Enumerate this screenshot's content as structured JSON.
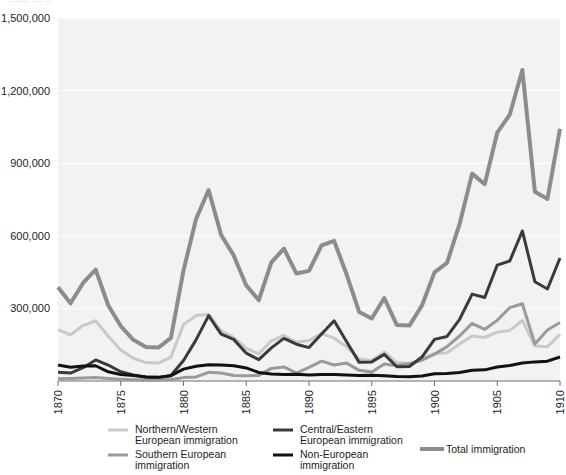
{
  "clipped_header": "......, .... ..",
  "chart_data": {
    "type": "line",
    "title": "",
    "xlabel": "",
    "ylabel": "",
    "xlim": [
      1870,
      1910
    ],
    "ylim": [
      0,
      1500000
    ],
    "grid": true,
    "legend_position": "bottom",
    "y_ticks": [
      {
        "value": 300000,
        "label": "300,000"
      },
      {
        "value": 600000,
        "label": "600,000"
      },
      {
        "value": 900000,
        "label": "900,000"
      },
      {
        "value": 1200000,
        "label": "1,200,000"
      },
      {
        "value": 1500000,
        "label": "1,500,000"
      }
    ],
    "x_ticks": [
      {
        "value": 1870,
        "label": "1870"
      },
      {
        "value": 1875,
        "label": "1875"
      },
      {
        "value": 1880,
        "label": "1880"
      },
      {
        "value": 1885,
        "label": "1885"
      },
      {
        "value": 1890,
        "label": "1890"
      },
      {
        "value": 1895,
        "label": "1895"
      },
      {
        "value": 1900,
        "label": "1900"
      },
      {
        "value": 1905,
        "label": "1905"
      },
      {
        "value": 1910,
        "label": "1910"
      }
    ],
    "x": [
      1870,
      1871,
      1872,
      1873,
      1874,
      1875,
      1876,
      1877,
      1878,
      1879,
      1880,
      1881,
      1882,
      1883,
      1884,
      1885,
      1886,
      1887,
      1888,
      1889,
      1890,
      1891,
      1892,
      1893,
      1894,
      1895,
      1896,
      1897,
      1898,
      1899,
      1900,
      1901,
      1902,
      1903,
      1904,
      1905,
      1906,
      1907,
      1908,
      1909,
      1910
    ],
    "series": [
      {
        "name": "Total immigration",
        "color": "#8c8c8c",
        "width": 4,
        "values": [
          387000,
          321000,
          405000,
          460000,
          313000,
          227000,
          170000,
          141000,
          138000,
          178000,
          457000,
          669000,
          789000,
          603000,
          519000,
          395000,
          334000,
          490000,
          547000,
          444000,
          455000,
          560000,
          579000,
          440000,
          285000,
          258000,
          343000,
          231000,
          229000,
          312000,
          449000,
          488000,
          649000,
          857000,
          813000,
          1026000,
          1101000,
          1285000,
          782000,
          752000,
          1042000
        ]
      },
      {
        "name": "Northern/Western European immigration",
        "color": "#c9c9c9",
        "width": 3,
        "values": [
          212000,
          191000,
          229000,
          249000,
          185000,
          128000,
          94000,
          76000,
          74000,
          99000,
          233000,
          271000,
          276000,
          207000,
          180000,
          135000,
          112000,
          166000,
          188000,
          160000,
          167000,
          196000,
          177000,
          142000,
          91000,
          85000,
          120000,
          76000,
          71000,
          92000,
          113000,
          117000,
          153000,
          186000,
          180000,
          202000,
          209000,
          250000,
          145000,
          142000,
          193000
        ]
      },
      {
        "name": "Southern European immigration",
        "color": "#9a9a9a",
        "width": 3,
        "values": [
          9000,
          10000,
          12000,
          14000,
          10000,
          7000,
          5000,
          4000,
          4000,
          6000,
          14000,
          17000,
          36000,
          33000,
          23000,
          22000,
          23000,
          52000,
          58000,
          33000,
          56000,
          82000,
          66000,
          74000,
          44000,
          37000,
          70000,
          63000,
          72000,
          86000,
          111000,
          142000,
          186000,
          238000,
          213000,
          251000,
          303000,
          319000,
          153000,
          211000,
          242000
        ]
      },
      {
        "name": "Central/Eastern European immigration",
        "color": "#3a3a3a",
        "width": 3,
        "values": [
          36000,
          33000,
          55000,
          87000,
          66000,
          38000,
          25000,
          17000,
          15000,
          23000,
          85000,
          170000,
          270000,
          194000,
          172000,
          115000,
          88000,
          137000,
          176000,
          152000,
          138000,
          194000,
          249000,
          162000,
          77000,
          79000,
          110000,
          59000,
          60000,
          99000,
          172000,
          184000,
          255000,
          359000,
          345000,
          479000,
          496000,
          620000,
          410000,
          380000,
          508000
        ]
      },
      {
        "name": "Non-European immigration",
        "color": "#111111",
        "width": 3,
        "values": [
          66000,
          57000,
          62000,
          63000,
          38000,
          27000,
          23000,
          17000,
          15000,
          22000,
          49000,
          61000,
          67000,
          66000,
          63000,
          54000,
          35000,
          29000,
          27000,
          28000,
          25000,
          27000,
          27000,
          25000,
          23000,
          24000,
          22000,
          19000,
          18000,
          21000,
          30000,
          31000,
          35000,
          44000,
          46000,
          58000,
          64000,
          74000,
          79000,
          82000,
          99000
        ]
      }
    ],
    "legend": [
      {
        "name": "Northern/Western European immigration",
        "line1": "Northern/Western",
        "line2": "European immigration",
        "color": "#c9c9c9",
        "width": 3
      },
      {
        "name": "Southern European immigration",
        "line1": "Southern European",
        "line2": "immigration",
        "color": "#9a9a9a",
        "width": 3
      },
      {
        "name": "Central/Eastern European immigration",
        "line1": "Central/Eastern",
        "line2": "European immigration",
        "color": "#3a3a3a",
        "width": 3
      },
      {
        "name": "Non-European immigration",
        "line1": "Non-European",
        "line2": "immigration",
        "color": "#111111",
        "width": 3
      },
      {
        "name": "Total immigration",
        "line1": "Total immigration",
        "line2": "",
        "color": "#8c8c8c",
        "width": 4
      }
    ]
  }
}
